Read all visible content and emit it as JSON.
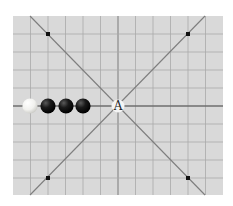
{
  "diagram": {
    "type": "gomoku-board",
    "board": {
      "left": 13,
      "top": 16,
      "right": 223,
      "bottom": 195,
      "background": "#d9d9d9",
      "grid_color": "#a9a9a9",
      "center_line_color": "#8a8a8a",
      "diagonal_color": "#7e7e7e"
    },
    "grid": {
      "vertical_lines_x": [
        30.5,
        48,
        65.5,
        83,
        100.5,
        118,
        135.5,
        153,
        170.5,
        188,
        205.5
      ],
      "horizontal_lines_y": [
        34,
        52,
        70,
        88,
        106,
        124,
        142,
        160,
        178
      ],
      "center_x": 118,
      "center_y": 106
    },
    "diagonals": [
      {
        "x1": 30,
        "y1": 16,
        "x2": 205,
        "y2": 195
      },
      {
        "x1": 205,
        "y1": 16,
        "x2": 30,
        "y2": 195
      }
    ],
    "star_points": [
      {
        "x": 48,
        "y": 34
      },
      {
        "x": 188,
        "y": 34
      },
      {
        "x": 48,
        "y": 178
      },
      {
        "x": 188,
        "y": 178
      }
    ],
    "stones": [
      {
        "color": "white",
        "x": 30,
        "y": 106
      },
      {
        "color": "black",
        "x": 48,
        "y": 106
      },
      {
        "color": "black",
        "x": 66,
        "y": 106
      },
      {
        "color": "black",
        "x": 83,
        "y": 106
      }
    ],
    "marker": {
      "label": "A",
      "x": 118,
      "y": 106
    }
  }
}
